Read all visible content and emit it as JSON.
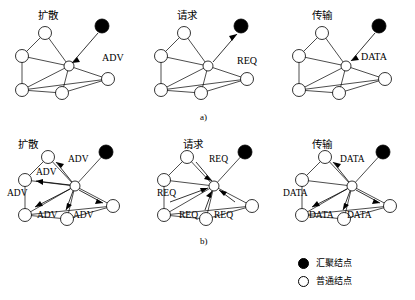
{
  "figure": {
    "rows": [
      {
        "id": "a",
        "label": "a)",
        "panels": [
          {
            "id": "a1",
            "title": "扩散",
            "message": "ADV",
            "direction": "inbound",
            "message_count": 1
          },
          {
            "id": "a2",
            "title": "请求",
            "message": "REQ",
            "direction": "outbound",
            "message_count": 1
          },
          {
            "id": "a3",
            "title": "传输",
            "message": "DATA",
            "direction": "inbound",
            "message_count": 1
          }
        ]
      },
      {
        "id": "b",
        "label": "b)",
        "panels": [
          {
            "id": "b1",
            "title": "扩散",
            "message": "ADV",
            "direction": "broadcast-out",
            "message_count": 5
          },
          {
            "id": "b2",
            "title": "请求",
            "message": "REQ",
            "direction": "broadcast-in",
            "message_count": 4
          },
          {
            "id": "b3",
            "title": "传输",
            "message": "DATA",
            "direction": "broadcast-out",
            "message_count": 4
          }
        ]
      }
    ],
    "legend": {
      "items": [
        {
          "marker": "filled-circle",
          "label": "汇聚结点"
        },
        {
          "marker": "hollow-circle",
          "label": "普通结点"
        }
      ]
    },
    "colors": {
      "stroke": "#000000",
      "node_fill": "#ffffff",
      "sink_fill": "#000000",
      "background": "#ffffff"
    },
    "labels": {
      "adv": "ADV",
      "req": "REQ",
      "data": "DATA"
    }
  }
}
